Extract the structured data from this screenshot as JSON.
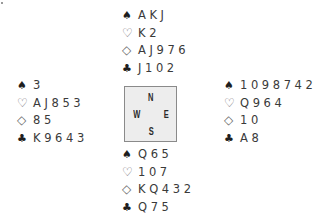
{
  "deal": {
    "north": {
      "spades": "AKJ",
      "hearts": "K2",
      "diamonds": "AJ976",
      "clubs": "J102"
    },
    "west": {
      "spades": "3",
      "hearts": "AJ853",
      "diamonds": "85",
      "clubs": "K9643"
    },
    "east": {
      "spades": "1098742",
      "hearts": "Q964",
      "diamonds": "10",
      "clubs": "A8"
    },
    "south": {
      "spades": "Q65",
      "hearts": "107",
      "diamonds": "KQ432",
      "clubs": "Q75"
    }
  },
  "suits": {
    "spades": "♠",
    "hearts": "♡",
    "diamonds": "◇",
    "clubs": "♣"
  },
  "compass": {
    "north": "N",
    "west": "W",
    "east": "E",
    "south": "S"
  },
  "colors": {
    "text": "#3a3a3a",
    "compass_fill": "#ededed",
    "compass_border": "#8a8a8a"
  }
}
